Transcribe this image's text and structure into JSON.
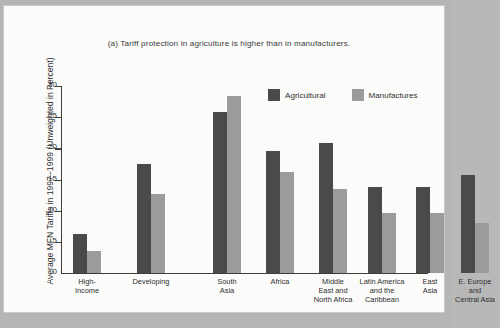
{
  "chart_data": {
    "type": "bar",
    "title": "(a) Tariff protection in agriculture is higher than in manufacturers.",
    "xlabel": "",
    "ylabel": "Average MFN Tariffs in 1997−1999 (Unweighted in Percent)",
    "ylim": [
      0,
      30
    ],
    "yticks": [
      0,
      5,
      10,
      15,
      20,
      25,
      30
    ],
    "ytick_labels": [
      "0",
      "5",
      "10",
      "15",
      "20",
      "25",
      "30"
    ],
    "grid": false,
    "legend_position": "upper right",
    "categories": [
      "High-\nIncome",
      "Developing",
      "South\nAsia",
      "Africa",
      "Middle\nEast and\nNorth Africa",
      "Latin America\nand the\nCaribbean",
      "East\nAsia",
      "E. Europe\nand\nCentral Asia"
    ],
    "series": [
      {
        "name": "Agricultural",
        "color": "#4a4a4a",
        "values": [
          6.2,
          17.5,
          25.9,
          19.5,
          20.9,
          13.8,
          13.8,
          15.7
        ]
      },
      {
        "name": "Manufactures",
        "color": "#9b9b9b",
        "values": [
          3.6,
          12.6,
          28.4,
          16.2,
          13.4,
          9.7,
          9.7,
          8.1
        ]
      }
    ]
  },
  "legend": {
    "items": [
      {
        "label": "Agricultural"
      },
      {
        "label": "Manufactures"
      }
    ]
  },
  "colors": {
    "agricultural": "#4a4a4a",
    "manufactures": "#9b9b9b",
    "axis": "#3d3d3d",
    "page": "#fbfbfa",
    "backdrop": "#b5b5b5"
  }
}
